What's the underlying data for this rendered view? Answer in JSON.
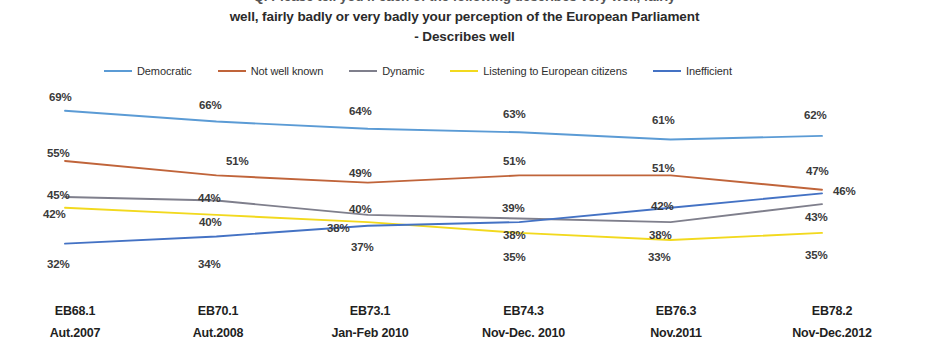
{
  "title": {
    "line1_clipped": "Q. Please tell you if each of the following describes very well, fairly",
    "line2": "well, fairly badly or very badly your perception of the European Parliament",
    "line3": "- Describes well"
  },
  "legend": {
    "position": "top",
    "items": [
      {
        "label": "Democratic",
        "color": "#5B9BD5",
        "swatch_name": "legend-line-democratic"
      },
      {
        "label": "Not well known",
        "color": "#C0643A",
        "swatch_name": "legend-line-not-well-known"
      },
      {
        "label": "Dynamic",
        "color": "#7F7F8C",
        "swatch_name": "legend-line-dynamic"
      },
      {
        "label": "Listening to European citizens",
        "color": "#F2D91E",
        "swatch_name": "legend-line-listening"
      },
      {
        "label": "Inefficient",
        "color": "#4472C4",
        "swatch_name": "legend-line-inefficient"
      }
    ]
  },
  "xaxis": {
    "ticks": [
      {
        "code": "EB68.1",
        "period": "Aut.2007"
      },
      {
        "code": "EB70.1",
        "period": "Aut.2008"
      },
      {
        "code": "EB73.1",
        "period": "Jan-Feb 2010"
      },
      {
        "code": "EB74.3",
        "period": "Nov-Dec. 2010"
      },
      {
        "code": "EB76.3",
        "period": "Nov.2011"
      },
      {
        "code": "EB78.2",
        "period": "Nov-Dec.2012"
      }
    ]
  },
  "chart_data": {
    "type": "line",
    "title": "Q. Please tell you if each of the following describes very well, fairly well, fairly badly or very badly your perception of the European Parliament - Describes well",
    "xlabel": "",
    "ylabel": "",
    "grid": false,
    "legend_position": "top",
    "value_suffix": "%",
    "categories": [
      "EB68.1 Aut.2007",
      "EB70.1 Aut.2008",
      "EB73.1 Jan-Feb 2010",
      "EB74.3 Nov-Dec. 2010",
      "EB76.3 Nov.2011",
      "EB78.2 Nov-Dec.2012"
    ],
    "ylim": [
      28,
      72
    ],
    "series": [
      {
        "name": "Democratic",
        "color": "#5B9BD5",
        "values": [
          69,
          66,
          64,
          63,
          61,
          62
        ],
        "labels": [
          "69%",
          "66%",
          "64%",
          "63%",
          "61%",
          "62%"
        ]
      },
      {
        "name": "Not well known",
        "color": "#C0643A",
        "values": [
          55,
          51,
          49,
          51,
          51,
          47
        ],
        "labels": [
          "55%",
          "51%",
          "49%",
          "51%",
          "51%",
          "47%"
        ]
      },
      {
        "name": "Dynamic",
        "color": "#7F7F8C",
        "values": [
          45,
          44,
          40,
          39,
          38,
          43
        ],
        "labels": [
          "45%",
          "44%",
          "40%",
          "39%",
          "38%",
          "43%"
        ]
      },
      {
        "name": "Listening to European citizens",
        "color": "#F2D91E",
        "values": [
          42,
          40,
          38,
          35,
          33,
          35
        ],
        "labels": [
          "42%",
          "40%",
          "38%",
          "35%",
          "33%",
          "35%"
        ]
      },
      {
        "name": "Inefficient",
        "color": "#4472C4",
        "values": [
          32,
          34,
          37,
          38,
          42,
          46
        ],
        "labels": [
          "32%",
          "34%",
          "37%",
          "38%",
          "42%",
          "46%"
        ]
      }
    ]
  },
  "data_labels": [
    {
      "name": "label-democratic-1",
      "text": "69%",
      "x": 49,
      "y": 91
    },
    {
      "name": "label-democratic-2",
      "text": "66%",
      "x": 199,
      "y": 99
    },
    {
      "name": "label-democratic-3",
      "text": "64%",
      "x": 349,
      "y": 105
    },
    {
      "name": "label-democratic-4",
      "text": "63%",
      "x": 503,
      "y": 108
    },
    {
      "name": "label-democratic-5",
      "text": "61%",
      "x": 652,
      "y": 114
    },
    {
      "name": "label-democratic-6",
      "text": "62%",
      "x": 804,
      "y": 109
    },
    {
      "name": "label-notwellknown-1",
      "text": "55%",
      "x": 47,
      "y": 147
    },
    {
      "name": "label-notwellknown-2",
      "text": "51%",
      "x": 226,
      "y": 155
    },
    {
      "name": "label-notwellknown-3",
      "text": "49%",
      "x": 349,
      "y": 167
    },
    {
      "name": "label-notwellknown-4",
      "text": "51%",
      "x": 503,
      "y": 155
    },
    {
      "name": "label-notwellknown-5",
      "text": "51%",
      "x": 652,
      "y": 162
    },
    {
      "name": "label-notwellknown-6",
      "text": "47%",
      "x": 806,
      "y": 165
    },
    {
      "name": "label-dynamic-1",
      "text": "45%",
      "x": 47,
      "y": 189
    },
    {
      "name": "label-dynamic-2",
      "text": "44%",
      "x": 198,
      "y": 192
    },
    {
      "name": "label-dynamic-3",
      "text": "40%",
      "x": 349,
      "y": 203
    },
    {
      "name": "label-dynamic-4",
      "text": "39%",
      "x": 502,
      "y": 202
    },
    {
      "name": "label-dynamic-5",
      "text": "42%",
      "x": 651,
      "y": 200
    },
    {
      "name": "label-dynamic-6",
      "text": "43%",
      "x": 805,
      "y": 211
    },
    {
      "name": "label-listening-1",
      "text": "42%",
      "x": 43,
      "y": 208
    },
    {
      "name": "label-listening-2",
      "text": "40%",
      "x": 199,
      "y": 216
    },
    {
      "name": "label-listening-3",
      "text": "38%",
      "x": 327,
      "y": 222
    },
    {
      "name": "label-listening-4",
      "text": "38%",
      "x": 503,
      "y": 229
    },
    {
      "name": "label-listening-5",
      "text": "38%",
      "x": 649,
      "y": 229
    },
    {
      "name": "label-listening-6",
      "text": "35%",
      "x": 805,
      "y": 249
    },
    {
      "name": "label-inefficient-1",
      "text": "32%",
      "x": 47,
      "y": 258
    },
    {
      "name": "label-inefficient-2",
      "text": "34%",
      "x": 198,
      "y": 258
    },
    {
      "name": "label-inefficient-3",
      "text": "37%",
      "x": 351,
      "y": 241
    },
    {
      "name": "label-inefficient-4",
      "text": "35%",
      "x": 503,
      "y": 251
    },
    {
      "name": "label-inefficient-5",
      "text": "33%",
      "x": 648,
      "y": 251
    },
    {
      "name": "label-inefficient-6",
      "text": "46%",
      "x": 833,
      "y": 185
    }
  ]
}
